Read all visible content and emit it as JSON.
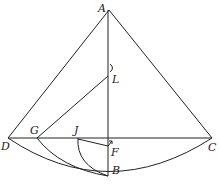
{
  "diagram": {
    "type": "geometric-construction",
    "points": {
      "A": {
        "label": "A",
        "x": 109,
        "y": 10
      },
      "B": {
        "label": "B",
        "x": 108,
        "y": 176
      },
      "C": {
        "label": "C",
        "x": 212,
        "y": 138
      },
      "D": {
        "label": "D",
        "x": 8,
        "y": 138
      },
      "F": {
        "label": "F",
        "x": 108,
        "y": 140
      },
      "G": {
        "label": "G",
        "x": 37,
        "y": 138
      },
      "J": {
        "label": "J",
        "x": 78,
        "y": 138
      },
      "L": {
        "label": "L",
        "x": 108,
        "y": 76
      }
    },
    "segments": [
      [
        "A",
        "D"
      ],
      [
        "A",
        "C"
      ],
      [
        "A",
        "B"
      ],
      [
        "D",
        "C"
      ],
      [
        "G",
        "L"
      ],
      [
        "J",
        "F"
      ]
    ],
    "arcs": [
      {
        "from": "D",
        "to": "C",
        "through": "B",
        "description": "large arc centered at A"
      },
      {
        "from": "G",
        "to": "B",
        "description": "arc from G to B"
      },
      {
        "from": "J",
        "to": "B",
        "description": "arc from J to B"
      }
    ],
    "labels": {
      "A": "A",
      "B": "B",
      "C": "C",
      "D": "D",
      "F": "F",
      "G": "G",
      "J": "J",
      "L": "L"
    },
    "stroke_color": "#222222"
  }
}
